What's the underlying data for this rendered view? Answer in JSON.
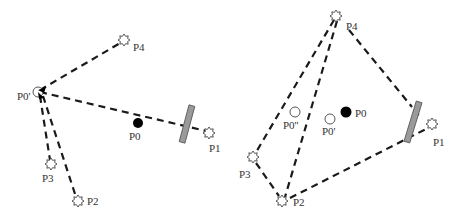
{
  "panels": [
    {
      "id": "left",
      "points": {
        "P4": {
          "label": "P4",
          "x": 124,
          "y": 40,
          "marker": "star"
        },
        "P0p": {
          "label": "P0'",
          "x": 38,
          "y": 92,
          "marker": "hollow-circle"
        },
        "P0": {
          "label": "P0",
          "x": 138,
          "y": 123,
          "marker": "solid-circle"
        },
        "P1": {
          "label": "P1",
          "x": 209,
          "y": 133,
          "marker": "star"
        },
        "P3": {
          "label": "P3",
          "x": 51,
          "y": 164,
          "marker": "star"
        },
        "P2": {
          "label": "P2",
          "x": 78,
          "y": 201,
          "marker": "star"
        }
      },
      "obstacle": {
        "label": "",
        "x": 187,
        "y": 124,
        "angle": 15
      }
    },
    {
      "id": "right",
      "points": {
        "P4": {
          "label": "P4",
          "x": 336,
          "y": 16,
          "marker": "star"
        },
        "P0pp": {
          "label": "P0''",
          "x": 295,
          "y": 112,
          "marker": "hollow-circle"
        },
        "P0p": {
          "label": "P0'",
          "x": 330,
          "y": 119,
          "marker": "hollow-circle"
        },
        "P0": {
          "label": "P0",
          "x": 346,
          "y": 112,
          "marker": "solid-circle"
        },
        "P1": {
          "label": "P1",
          "x": 432,
          "y": 124,
          "marker": "star"
        },
        "P3": {
          "label": "P3",
          "x": 253,
          "y": 157,
          "marker": "star"
        },
        "P2": {
          "label": "P2",
          "x": 282,
          "y": 201,
          "marker": "star"
        }
      },
      "obstacle": {
        "label": "",
        "x": 413,
        "y": 122,
        "angle": 15
      }
    }
  ],
  "labels": {
    "left_P4": "P4",
    "left_P0p": "P0'",
    "left_P0": "P0",
    "left_P1": "P1",
    "left_P3": "P3",
    "left_P2": "P2",
    "right_P4": "P4",
    "right_P0pp": "P0''",
    "right_P0p": "P0'",
    "right_P0": "P0",
    "right_P1": "P1",
    "right_P3": "P3",
    "right_P2": "P2"
  },
  "colors": {
    "line": "#1a1a1a",
    "obstacle": "#9a9a9a",
    "solid_point": "#000000",
    "text": "#333333"
  }
}
